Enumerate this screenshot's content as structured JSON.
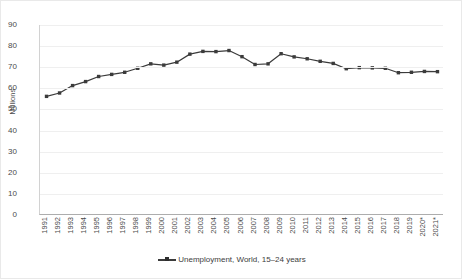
{
  "chart_data": {
    "type": "line",
    "title": "",
    "xlabel": "",
    "ylabel": "Millions",
    "ylim": [
      0,
      90
    ],
    "ytick_step": 10,
    "yticks": [
      90,
      80,
      70,
      60,
      50,
      40,
      30,
      20,
      10,
      0
    ],
    "grid": true,
    "legend_position": "bottom",
    "categories": [
      "1991",
      "1992",
      "1993",
      "1994",
      "1995",
      "1996",
      "1997",
      "1998",
      "1999",
      "2000",
      "2001",
      "2002",
      "2003",
      "2004",
      "2005",
      "2006",
      "2007",
      "2008",
      "2009",
      "2010",
      "2011",
      "2012",
      "2013",
      "2014",
      "2015",
      "2016",
      "2017",
      "2018",
      "2019",
      "2020*",
      "2021*"
    ],
    "series": [
      {
        "name": "Unemployment, World, 15–24 years",
        "color": "#3b3b3b",
        "marker": "square",
        "values": [
          56.2,
          57.8,
          61.3,
          63.2,
          65.6,
          66.6,
          67.6,
          69.5,
          71.6,
          71.0,
          72.4,
          76.2,
          77.5,
          77.4,
          77.9,
          75.0,
          71.3,
          71.6,
          76.4,
          74.9,
          74.0,
          72.8,
          71.8,
          69.3,
          69.8,
          69.7,
          69.5,
          67.4,
          67.6,
          68.0,
          67.9
        ]
      }
    ]
  },
  "legend": {
    "entry_label": "Unemployment, World, 15–24 years"
  },
  "axis": {
    "y_title": "Millions"
  }
}
